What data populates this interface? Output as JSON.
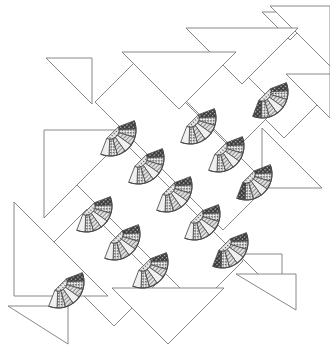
{
  "figure": {
    "width": 330,
    "height": 350,
    "background_color": "#ffffff",
    "outline_color": "#7a7a7a",
    "outline_width": 0.9
  },
  "palette": {
    "background": "#ffffff",
    "line": "#7a7a7a",
    "fan_outline": "#4a4a4a",
    "blade_light": "#f0f0f0",
    "blade_mid": "#cfcfcf",
    "blade_dark": "#9d9d9d",
    "blade_darkest": "#3f3f3f",
    "hub_fill": "#e8e8e8",
    "dot_color": "#4a4a4a",
    "stripe_color": "#666666"
  },
  "geometry": {
    "band_angle_deg": -45,
    "fan_radius": 26,
    "fan_hub_radius": 9,
    "fan_sweep_deg": 132,
    "blade_count": 7,
    "triangle_leg": 58
  },
  "bands": [
    {
      "name": "upper-right-band",
      "fan_count": 3,
      "label": "Upper right diagonal band"
    },
    {
      "name": "middle-band",
      "fan_count": 5,
      "label": "Central diagonal band"
    },
    {
      "name": "lower-left-band",
      "fan_count": 3,
      "label": "Lower left diagonal band"
    }
  ],
  "fans": [
    {
      "id": "fan-1",
      "cx": 262,
      "cy": 92,
      "rot": 135,
      "dark_side": "right",
      "radius": 26
    },
    {
      "id": "fan-2",
      "cx": 190,
      "cy": 118,
      "rot": 135,
      "dark_side": "none",
      "radius": 26
    },
    {
      "id": "fan-3",
      "cx": 218,
      "cy": 146,
      "rot": 135,
      "dark_side": "none",
      "radius": 26
    },
    {
      "id": "fan-4",
      "cx": 246,
      "cy": 174,
      "rot": 135,
      "dark_side": "right",
      "radius": 26
    },
    {
      "id": "fan-5",
      "cx": 110,
      "cy": 130,
      "rot": 135,
      "dark_side": "left",
      "radius": 26
    },
    {
      "id": "fan-6",
      "cx": 138,
      "cy": 158,
      "rot": 135,
      "dark_side": "none",
      "radius": 26
    },
    {
      "id": "fan-7",
      "cx": 166,
      "cy": 186,
      "rot": 135,
      "dark_side": "none",
      "radius": 26
    },
    {
      "id": "fan-8",
      "cx": 194,
      "cy": 214,
      "rot": 135,
      "dark_side": "none",
      "radius": 26
    },
    {
      "id": "fan-9",
      "cx": 222,
      "cy": 242,
      "rot": 135,
      "dark_side": "right",
      "radius": 26
    },
    {
      "id": "fan-10",
      "cx": 86,
      "cy": 206,
      "rot": 135,
      "dark_side": "left",
      "radius": 26
    },
    {
      "id": "fan-11",
      "cx": 114,
      "cy": 234,
      "rot": 135,
      "dark_side": "none",
      "radius": 26
    },
    {
      "id": "fan-12",
      "cx": 142,
      "cy": 262,
      "rot": 135,
      "dark_side": "none",
      "radius": 26
    },
    {
      "id": "fan-13",
      "cx": 58,
      "cy": 282,
      "rot": 135,
      "dark_side": "left",
      "radius": 26
    }
  ],
  "blade_textures": [
    "dark-solid",
    "dots",
    "stripes",
    "light",
    "stripes",
    "dots",
    "light"
  ],
  "triangles": [
    {
      "id": "tri-1",
      "points": "262,12 318,12 290,40",
      "note": "top right small"
    },
    {
      "id": "tri-2",
      "points": "270,6 330,6 330,66",
      "note": "top right corner"
    },
    {
      "id": "tri-3",
      "points": "186,28 298,28 242,84",
      "note": "top wide down"
    },
    {
      "id": "tri-4",
      "points": "122,52 236,52 179,109",
      "note": "upper middle down"
    },
    {
      "id": "tri-5",
      "points": "46,58 92,58 92,104",
      "note": "left small"
    },
    {
      "id": "tri-6",
      "points": "286,74 330,74 330,118",
      "note": "right edge"
    },
    {
      "id": "tri-7",
      "points": "44,130 44,218 132,130",
      "note": "left large"
    },
    {
      "id": "tri-8",
      "points": "262,128 322,188 262,188",
      "note": "right large"
    },
    {
      "id": "tri-9",
      "points": "14,202 14,296 108,296",
      "note": "lower left large"
    },
    {
      "id": "tri-10",
      "points": "238,254 282,254 282,298",
      "note": "bottom right small"
    },
    {
      "id": "tri-11",
      "points": "236,274 296,274 296,310",
      "note": "bottom right"
    },
    {
      "id": "tri-12",
      "points": "112,288 224,288 168,344",
      "note": "bottom wide down"
    },
    {
      "id": "tri-13",
      "points": "8,306 68,306 68,344",
      "note": "bottom left corner"
    }
  ],
  "band_outlines": [
    {
      "id": "band-outline-1",
      "points": "246,62 292,16 330,54 330,92 284,138 246,100"
    },
    {
      "id": "band-outline-2",
      "points": "175,90 218,47 278,107 235,150"
    },
    {
      "id": "band-outline-3",
      "points": "95,102 140,57 268,185 223,230"
    },
    {
      "id": "band-outline-4",
      "points": "70,178 115,133 243,261 198,306"
    },
    {
      "id": "band-outline-5",
      "points": "42,254 87,209 159,281 114,326"
    }
  ]
}
